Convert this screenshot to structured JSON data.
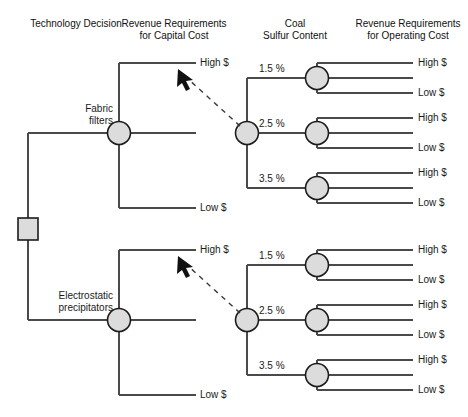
{
  "diagram": {
    "type": "decision-tree",
    "title": "",
    "headers": [
      {
        "id": "technology-decision",
        "line1": "Technology Decision",
        "line2": ""
      },
      {
        "id": "revenue-capital",
        "line1": "Revenue Requirements",
        "line2": "for Capital Cost"
      },
      {
        "id": "coal-sulfur",
        "line1": "Coal",
        "line2": "Sulfur Content"
      },
      {
        "id": "revenue-operating",
        "line1": "Revenue Requirements",
        "line2": "for Operating Cost"
      }
    ],
    "decision_node": {
      "id": "technology-decision-node",
      "shape": "square"
    },
    "alternatives": [
      {
        "id": "fabric-filters",
        "line1": "Fabric",
        "line2": "filters"
      },
      {
        "id": "electrostatic-precipitators",
        "line1": "Electrostatic",
        "line2": "precipitators"
      }
    ],
    "capital_cost_outcomes": [
      {
        "label": "High $"
      },
      {
        "label": ""
      },
      {
        "label": "Low $"
      }
    ],
    "sulfur_levels": [
      {
        "label": "1.5 %"
      },
      {
        "label": "2.5 %"
      },
      {
        "label": "3.5 %"
      }
    ],
    "operating_cost_outcomes": [
      {
        "label": "High $"
      },
      {
        "label": ""
      },
      {
        "label": "Low $"
      }
    ],
    "annotation_arrows": [
      {
        "id": "upper-link-arrow",
        "style": "dashed",
        "points_to": "High $"
      },
      {
        "id": "lower-link-arrow",
        "style": "dashed",
        "points_to": "High $"
      }
    ],
    "colors": {
      "node_fill": "#dcdcdc",
      "node_stroke": "#1c1c1c",
      "line": "#4a4a4a",
      "text": "#1a1a1a"
    }
  }
}
